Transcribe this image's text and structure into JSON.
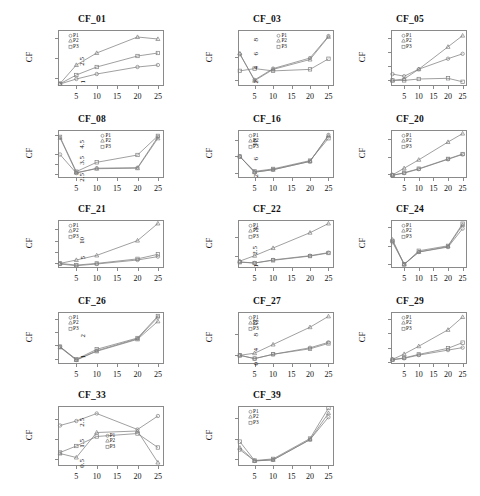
{
  "figure": {
    "kind": "multi-panel-line-chart-grid",
    "panel_count": 14,
    "columns": 3,
    "rows": 5,
    "axis_color": "#8a8a8a",
    "line_color": "#808080",
    "text_color": "#111111",
    "background": "#ffffff"
  },
  "legend": {
    "entries": [
      {
        "label": "P1",
        "marker": "circle"
      },
      {
        "label": "P2",
        "marker": "triangle"
      },
      {
        "label": "P3",
        "marker": "square"
      }
    ]
  },
  "common": {
    "ylabel": "CF",
    "xticks": [
      "5",
      "10",
      "15",
      "20",
      "25"
    ],
    "xtick_values": [
      5,
      10,
      15,
      20,
      25
    ],
    "xlim": [
      0.5,
      26.5
    ]
  },
  "chart_data": [
    {
      "type": "line",
      "title": "CF_01",
      "xlabel": "",
      "ylabel": "CF",
      "x": [
        1,
        5,
        10,
        20,
        25
      ],
      "xticks": [
        5,
        10,
        15,
        20,
        25
      ],
      "yticks": [
        5,
        15,
        25
      ],
      "ylim": [
        1,
        29
      ],
      "xlim": [
        0.5,
        26.5
      ],
      "grid": false,
      "legend_position": "top-left",
      "series": [
        {
          "name": "P1",
          "marker": "circle",
          "values": [
            2.0,
            4.5,
            7.0,
            10.5,
            11.5
          ]
        },
        {
          "name": "P2",
          "marker": "triangle",
          "values": [
            2.2,
            11.5,
            17.5,
            25.5,
            24.5
          ]
        },
        {
          "name": "P3",
          "marker": "square",
          "values": [
            2.1,
            6.5,
            10.5,
            16.0,
            17.5
          ]
        }
      ]
    },
    {
      "type": "line",
      "title": "CF_03",
      "xlabel": "",
      "ylabel": "CF",
      "x": [
        1,
        5,
        10,
        20,
        25
      ],
      "xticks": [
        5,
        10,
        15,
        20,
        25
      ],
      "yticks": [
        1.0,
        2.5
      ],
      "ylim": [
        0.6,
        4.3
      ],
      "xlim": [
        0.5,
        26.5
      ],
      "grid": false,
      "legend_position": "top-center",
      "series": [
        {
          "name": "P1",
          "marker": "circle",
          "values": [
            2.7,
            1.0,
            1.75,
            2.45,
            3.9
          ]
        },
        {
          "name": "P2",
          "marker": "triangle",
          "values": [
            2.75,
            0.95,
            1.7,
            2.35,
            3.85
          ]
        },
        {
          "name": "P3",
          "marker": "square",
          "values": [
            1.6,
            1.75,
            1.6,
            1.7,
            2.4
          ]
        }
      ]
    },
    {
      "type": "line",
      "title": "CF_05",
      "xlabel": "",
      "ylabel": "CF",
      "x": [
        1,
        5,
        10,
        20,
        25
      ],
      "xticks": [
        5,
        10,
        15,
        20,
        25
      ],
      "yticks": [
        2,
        4,
        6,
        8
      ],
      "ylim": [
        1.2,
        9.2
      ],
      "xlim": [
        0.5,
        26.5
      ],
      "grid": false,
      "legend_position": "top-left",
      "series": [
        {
          "name": "P1",
          "marker": "circle",
          "values": [
            2.9,
            2.6,
            3.6,
            5.1,
            5.8
          ]
        },
        {
          "name": "P2",
          "marker": "triangle",
          "values": [
            2.0,
            2.2,
            3.6,
            6.8,
            8.4
          ]
        },
        {
          "name": "P3",
          "marker": "square",
          "values": [
            2.0,
            2.0,
            2.2,
            2.3,
            1.8
          ]
        }
      ]
    },
    {
      "type": "line",
      "title": "CF_08",
      "xlabel": "",
      "ylabel": "CF",
      "x": [
        1,
        5,
        10,
        20,
        25
      ],
      "xticks": [
        5,
        10,
        15,
        20,
        25
      ],
      "yticks": [
        4,
        6,
        8,
        12
      ],
      "ylim": [
        3.2,
        13.0
      ],
      "xlim": [
        0.5,
        26.5
      ],
      "grid": false,
      "legend_position": "top-center",
      "series": [
        {
          "name": "P1",
          "marker": "circle",
          "values": [
            8.0,
            4.2,
            5.2,
            5.3,
            11.6
          ]
        },
        {
          "name": "P2",
          "marker": "triangle",
          "values": [
            11.4,
            4.3,
            5.1,
            5.2,
            11.3
          ]
        },
        {
          "name": "P3",
          "marker": "square",
          "values": [
            11.6,
            4.5,
            6.4,
            7.9,
            11.8
          ]
        }
      ]
    },
    {
      "type": "line",
      "title": "CF_16",
      "xlabel": "",
      "ylabel": "CF",
      "x": [
        1,
        5,
        10,
        20,
        25
      ],
      "xticks": [
        5,
        10,
        15,
        20,
        25
      ],
      "yticks": [
        2.5,
        3.5,
        4.5
      ],
      "ylim": [
        2.2,
        5.1
      ],
      "xlim": [
        0.5,
        26.5
      ],
      "grid": false,
      "legend_position": "top-left",
      "series": [
        {
          "name": "P1",
          "marker": "circle",
          "values": [
            3.5,
            2.55,
            2.7,
            3.2,
            4.8
          ]
        },
        {
          "name": "P2",
          "marker": "triangle",
          "values": [
            3.5,
            2.55,
            2.7,
            3.2,
            4.75
          ]
        },
        {
          "name": "P3",
          "marker": "square",
          "values": [
            3.5,
            2.6,
            2.75,
            3.25,
            4.6
          ]
        }
      ]
    },
    {
      "type": "line",
      "title": "CF_20",
      "xlabel": "",
      "ylabel": "CF",
      "x": [
        1,
        5,
        10,
        20,
        25
      ],
      "xticks": [
        5,
        10,
        15,
        20,
        25
      ],
      "yticks": [
        2,
        6,
        10
      ],
      "ylim": [
        1.2,
        12.0
      ],
      "xlim": [
        0.5,
        26.5
      ],
      "grid": false,
      "legend_position": "top-left",
      "series": [
        {
          "name": "P1",
          "marker": "circle",
          "values": [
            1.8,
            2.3,
            3.2,
            5.4,
            6.5
          ]
        },
        {
          "name": "P2",
          "marker": "triangle",
          "values": [
            1.9,
            3.4,
            5.3,
            9.3,
            11.2
          ]
        },
        {
          "name": "P3",
          "marker": "square",
          "values": [
            1.8,
            2.4,
            3.3,
            5.5,
            6.6
          ]
        }
      ]
    },
    {
      "type": "line",
      "title": "CF_21",
      "xlabel": "",
      "ylabel": "CF",
      "x": [
        1,
        5,
        10,
        20,
        25
      ],
      "xticks": [
        5,
        10,
        15,
        20,
        25
      ],
      "yticks": [
        2,
        4,
        6,
        8
      ],
      "ylim": [
        1.2,
        9.6
      ],
      "xlim": [
        0.5,
        26.5
      ],
      "grid": false,
      "legend_position": "top-left",
      "series": [
        {
          "name": "P1",
          "marker": "circle",
          "values": [
            1.9,
            1.6,
            1.9,
            2.6,
            3.2
          ]
        },
        {
          "name": "P2",
          "marker": "triangle",
          "values": [
            2.0,
            2.6,
            3.4,
            6.0,
            9.0
          ]
        },
        {
          "name": "P3",
          "marker": "square",
          "values": [
            2.0,
            1.7,
            2.0,
            2.8,
            3.6
          ]
        }
      ]
    },
    {
      "type": "line",
      "title": "CF_22",
      "xlabel": "",
      "ylabel": "CF",
      "x": [
        1,
        5,
        10,
        20,
        25
      ],
      "xticks": [
        5,
        10,
        15,
        20,
        25
      ],
      "yticks": [
        5,
        10
      ],
      "ylim": [
        2.0,
        14.5
      ],
      "xlim": [
        0.5,
        26.5
      ],
      "grid": false,
      "legend_position": "top-left",
      "series": [
        {
          "name": "P1",
          "marker": "circle",
          "values": [
            3.6,
            3.3,
            4.1,
            5.2,
            6.0
          ]
        },
        {
          "name": "P2",
          "marker": "triangle",
          "values": [
            3.8,
            5.2,
            7.2,
            11.2,
            13.6
          ]
        },
        {
          "name": "P3",
          "marker": "square",
          "values": [
            3.5,
            3.3,
            4.0,
            5.1,
            5.9
          ]
        }
      ]
    },
    {
      "type": "line",
      "title": "CF_24",
      "xlabel": "",
      "ylabel": "CF",
      "x": [
        1,
        5,
        10,
        20,
        25
      ],
      "xticks": [
        5,
        10,
        15,
        20,
        25
      ],
      "yticks": [
        1.0,
        2.5,
        4.0
      ],
      "ylim": [
        0.7,
        4.6
      ],
      "xlim": [
        0.5,
        26.5
      ],
      "grid": false,
      "legend_position": "top-left",
      "series": [
        {
          "name": "P1",
          "marker": "circle",
          "values": [
            2.8,
            1.0,
            2.0,
            2.4,
            3.9
          ]
        },
        {
          "name": "P2",
          "marker": "triangle",
          "values": [
            3.0,
            1.0,
            2.0,
            2.45,
            4.2
          ]
        },
        {
          "name": "P3",
          "marker": "square",
          "values": [
            2.9,
            1.0,
            2.1,
            2.5,
            4.3
          ]
        }
      ]
    },
    {
      "type": "line",
      "title": "CF_26",
      "xlabel": "",
      "ylabel": "CF",
      "x": [
        1,
        5,
        10,
        20,
        25
      ],
      "xticks": [
        5,
        10,
        15,
        20,
        25
      ],
      "yticks": [
        1,
        2,
        3,
        4
      ],
      "ylim": [
        0.6,
        4.5
      ],
      "xlim": [
        0.5,
        26.5
      ],
      "grid": false,
      "legend_position": "top-left",
      "series": [
        {
          "name": "P1",
          "marker": "circle",
          "values": [
            1.9,
            0.9,
            1.6,
            2.5,
            4.1
          ]
        },
        {
          "name": "P2",
          "marker": "triangle",
          "values": [
            1.85,
            0.9,
            1.55,
            2.45,
            3.8
          ]
        },
        {
          "name": "P3",
          "marker": "square",
          "values": [
            1.9,
            0.95,
            1.7,
            2.55,
            4.2
          ]
        }
      ]
    },
    {
      "type": "line",
      "title": "CF_27",
      "xlabel": "",
      "ylabel": "CF",
      "x": [
        1,
        5,
        10,
        20,
        25
      ],
      "xticks": [
        5,
        10,
        15,
        20,
        25
      ],
      "yticks": [
        1.0,
        2.0
      ],
      "ylim": [
        0.6,
        3.0
      ],
      "xlim": [
        0.5,
        26.5
      ],
      "grid": false,
      "legend_position": "top-left",
      "series": [
        {
          "name": "P1",
          "marker": "circle",
          "values": [
            1.0,
            0.85,
            1.05,
            1.35,
            1.6
          ]
        },
        {
          "name": "P2",
          "marker": "triangle",
          "values": [
            1.0,
            1.1,
            1.5,
            2.3,
            2.8
          ]
        },
        {
          "name": "P3",
          "marker": "square",
          "values": [
            1.0,
            0.85,
            1.05,
            1.3,
            1.55
          ]
        }
      ]
    },
    {
      "type": "line",
      "title": "CF_29",
      "xlabel": "",
      "ylabel": "CF",
      "x": [
        1,
        5,
        10,
        20,
        25
      ],
      "xticks": [
        5,
        10,
        15,
        20,
        25
      ],
      "yticks": [
        0,
        4,
        8,
        12
      ],
      "ylim": [
        -0.6,
        14.0
      ],
      "xlim": [
        0.5,
        26.5
      ],
      "grid": false,
      "legend_position": "top-left",
      "series": [
        {
          "name": "P1",
          "marker": "circle",
          "values": [
            0.6,
            1.0,
            1.9,
            3.3,
            4.0
          ]
        },
        {
          "name": "P2",
          "marker": "triangle",
          "values": [
            0.7,
            2.2,
            4.4,
            9.0,
            12.6
          ]
        },
        {
          "name": "P3",
          "marker": "square",
          "values": [
            0.6,
            1.1,
            2.1,
            3.8,
            5.4
          ]
        }
      ]
    },
    {
      "type": "line",
      "title": "CF_33",
      "xlabel": "",
      "ylabel": "CF",
      "x": [
        1,
        5,
        10,
        20,
        25
      ],
      "xticks": [
        5,
        10,
        15,
        20,
        25
      ],
      "yticks": [
        0.2,
        0.6,
        1.0
      ],
      "ylim": [
        0.05,
        1.25
      ],
      "xlim": [
        0.5,
        26.5
      ],
      "grid": false,
      "legend_position": "middle",
      "series": [
        {
          "name": "P1",
          "marker": "circle",
          "values": [
            0.86,
            0.95,
            1.1,
            0.78,
            1.05
          ]
        },
        {
          "name": "P2",
          "marker": "triangle",
          "values": [
            0.3,
            0.22,
            0.72,
            0.75,
            0.12
          ]
        },
        {
          "name": "P3",
          "marker": "square",
          "values": [
            0.32,
            0.45,
            0.64,
            0.7,
            0.42
          ]
        }
      ]
    },
    {
      "type": "line",
      "title": "CF_39",
      "xlabel": "",
      "ylabel": "CF",
      "x": [
        1,
        5,
        10,
        20,
        25
      ],
      "xticks": [
        5,
        10,
        15,
        20,
        25
      ],
      "yticks": [
        0.5,
        1.5,
        2.5
      ],
      "ylim": [
        0.15,
        3.1
      ],
      "xlim": [
        0.5,
        26.5
      ],
      "grid": false,
      "legend_position": "top-left",
      "series": [
        {
          "name": "P1",
          "marker": "circle",
          "values": [
            0.95,
            0.4,
            0.45,
            1.45,
            2.55
          ]
        },
        {
          "name": "P2",
          "marker": "triangle",
          "values": [
            1.05,
            0.4,
            0.45,
            1.45,
            2.75
          ]
        },
        {
          "name": "P3",
          "marker": "square",
          "values": [
            1.35,
            0.42,
            0.5,
            1.5,
            3.0
          ]
        }
      ]
    }
  ]
}
